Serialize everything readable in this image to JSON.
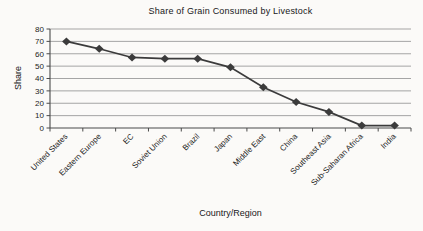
{
  "chart_data": {
    "type": "line",
    "title": "Share of Grain Consumed by Livestock",
    "xlabel": "Country/Region",
    "ylabel": "Share",
    "categories": [
      "United States",
      "Eastern Europe",
      "EC",
      "Soviet Union",
      "Brazil",
      "Japan",
      "Middle East",
      "China",
      "Southeast Asia",
      "Sub-Saharan Africa",
      "India"
    ],
    "values": [
      70,
      64,
      57,
      56,
      56,
      49,
      33,
      21,
      13,
      2,
      2
    ],
    "ylim": [
      0,
      80
    ],
    "yticks": [
      0,
      10,
      20,
      30,
      40,
      50,
      60,
      70,
      80
    ],
    "grid": "horizontal",
    "legend": "none",
    "marker": "diamond",
    "x_tick_label_rotation": -45,
    "colors": {
      "series": "#3b3b3b",
      "gridline": "#9b9b9b",
      "axis": "#4a4a4a",
      "text": "#1c1c1c",
      "background": "#fbfaf8"
    }
  }
}
